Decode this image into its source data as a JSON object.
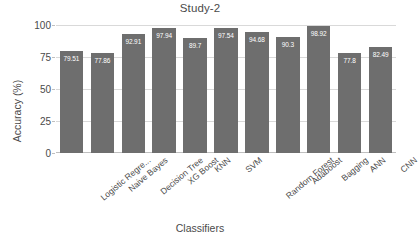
{
  "chart_data": {
    "type": "bar",
    "title": "Study-2",
    "xlabel": "Classifiers",
    "ylabel": "Accuracy (%)",
    "ylim": [
      0,
      100
    ],
    "yticks": [
      0,
      25,
      50,
      75,
      100
    ],
    "ytick_labels": [
      "0",
      "25",
      "50",
      "75",
      "100"
    ],
    "grid": true,
    "legend": false,
    "bar_color": "#6e6e6e",
    "value_label_color": "#ffffff",
    "categories": [
      "Logistic Regre...",
      "Naive Bayes",
      "Decision Tree",
      "XG Boost",
      "KNN",
      "SVM",
      "Random Forest",
      "Adaboost",
      "Bagging",
      "ANN",
      "CNN"
    ],
    "values": [
      79.51,
      77.86,
      92.91,
      97.94,
      89.7,
      97.54,
      94.68,
      90.3,
      98.92,
      77.8,
      82.49
    ],
    "value_labels": [
      "79.51",
      "77.86",
      "92.91",
      "97.94",
      "89.7",
      "97.54",
      "94.68",
      "90.3",
      "98.92",
      "77.8",
      "82.49"
    ]
  }
}
